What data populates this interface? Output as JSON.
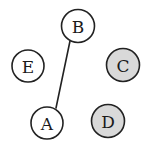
{
  "figure": {
    "kind": "node-link-graph",
    "width": 154,
    "height": 157,
    "background": "#ffffff"
  },
  "style": {
    "stroke_color": "#222222",
    "stroke_width": 1.6,
    "label_color": "#1a1a1a",
    "fill_white": "#ffffff",
    "fill_gray": "#d9d9d9"
  },
  "nodes": [
    {
      "id": "B",
      "label": "B",
      "cx": 78,
      "cy": 26,
      "r": 16.5,
      "fill": "#ffffff",
      "shaded": false
    },
    {
      "id": "E",
      "label": "E",
      "cx": 28,
      "cy": 66,
      "r": 16.0,
      "fill": "#ffffff",
      "shaded": false
    },
    {
      "id": "C",
      "label": "C",
      "cx": 123,
      "cy": 65,
      "r": 16.5,
      "fill": "#d9d9d9",
      "shaded": true
    },
    {
      "id": "A",
      "label": "A",
      "cx": 47,
      "cy": 123,
      "r": 16.0,
      "fill": "#ffffff",
      "shaded": false
    },
    {
      "id": "D",
      "label": "D",
      "cx": 108,
      "cy": 121,
      "r": 16.5,
      "fill": "#d9d9d9",
      "shaded": true
    }
  ],
  "edges": [
    {
      "id": "A-B",
      "source": "A",
      "target": "B",
      "x1": 56,
      "y1": 108,
      "x2": 70,
      "y2": 41
    }
  ]
}
